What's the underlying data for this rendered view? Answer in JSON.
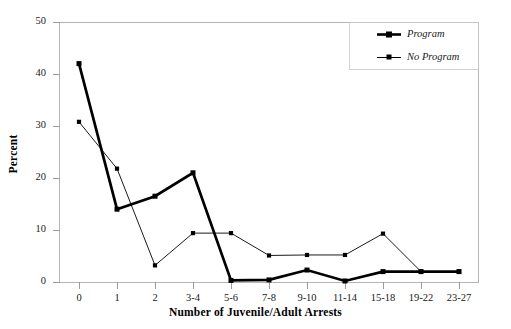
{
  "chart_data": {
    "type": "line",
    "title": "",
    "xlabel": "Number of Juvenile/Adult Arrests",
    "ylabel": "Percent",
    "categories": [
      "0",
      "1",
      "2",
      "3-4",
      "5-6",
      "7-8",
      "9-10",
      "11-14",
      "15-18",
      "19-22",
      "23-27"
    ],
    "ylim": [
      0,
      50
    ],
    "yticks": [
      0,
      10,
      20,
      30,
      40,
      50
    ],
    "ytick_labels": [
      "0",
      "10",
      "20",
      "30",
      "40",
      "50"
    ],
    "grid": false,
    "legend_position": "top-right",
    "series": [
      {
        "name": "Program",
        "style": "thick",
        "color": "#000000",
        "marker": "square",
        "values": [
          42.0,
          14.0,
          16.5,
          21.0,
          0.3,
          0.4,
          2.3,
          0.2,
          2.0,
          2.0,
          2.0
        ]
      },
      {
        "name": "No Program",
        "style": "thin",
        "color": "#000000",
        "marker": "square",
        "values": [
          30.8,
          21.8,
          3.2,
          9.4,
          9.4,
          5.1,
          5.2,
          5.2,
          9.3,
          2.0,
          2.0
        ]
      }
    ]
  },
  "legend": {
    "entries": [
      {
        "label": "Program"
      },
      {
        "label": "No Program"
      }
    ]
  },
  "colors": {
    "frame": "#b5b5b5",
    "tick": "#9a9a9a",
    "line": "#000000",
    "text": "#1a1a1a",
    "background": "#ffffff"
  }
}
